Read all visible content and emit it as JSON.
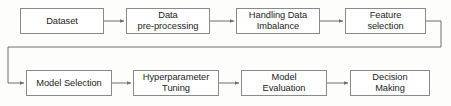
{
  "diagram": {
    "background_color": "#fdfdfc",
    "box_fill": "#ffffff",
    "box_border_color": "#8a8a8a",
    "connector_color": "#6f6f6f",
    "text_color": "#1d1d1d",
    "rows": [
      {
        "name": "top-row",
        "nodes": [
          {
            "id": "dataset",
            "label": "Dataset",
            "x": 20,
            "y": 8,
            "w": 84,
            "h": 26
          },
          {
            "id": "data-preprocessing",
            "label": "Data\npre-processing",
            "x": 126,
            "y": 8,
            "w": 84,
            "h": 26
          },
          {
            "id": "handling-data-imbalance",
            "label": "Handling Data\nImbalance",
            "x": 236,
            "y": 8,
            "w": 84,
            "h": 26
          },
          {
            "id": "feature-selection",
            "label": "Feature\nselection",
            "x": 345,
            "y": 8,
            "w": 81,
            "h": 26
          }
        ]
      },
      {
        "name": "bottom-row",
        "nodes": [
          {
            "id": "model-selection",
            "label": "Model Selection",
            "x": 26,
            "y": 70,
            "w": 86,
            "h": 26
          },
          {
            "id": "hyperparameter-tuning",
            "label": "Hyperparameter\nTuning",
            "x": 133,
            "y": 70,
            "w": 86,
            "h": 26
          },
          {
            "id": "model-evaluation",
            "label": "Model\nEvaluation",
            "x": 241,
            "y": 70,
            "w": 86,
            "h": 26
          },
          {
            "id": "decision-making",
            "label": "Decision\nMaking",
            "x": 350,
            "y": 70,
            "w": 80,
            "h": 26
          }
        ]
      }
    ],
    "connectors": [
      {
        "id": "dataset-to-preprocessing",
        "from": "dataset",
        "to": "data-preprocessing",
        "type": "straight-arrow"
      },
      {
        "id": "preprocessing-to-imbalance",
        "from": "data-preprocessing",
        "to": "handling-data-imbalance",
        "type": "straight-arrow"
      },
      {
        "id": "imbalance-to-feature-selection",
        "from": "handling-data-imbalance",
        "to": "feature-selection",
        "type": "straight-arrow"
      },
      {
        "id": "feature-selection-to-model-selection",
        "from": "feature-selection",
        "to": "model-selection",
        "type": "wrap-around-arrow"
      },
      {
        "id": "model-selection-to-tuning",
        "from": "model-selection",
        "to": "hyperparameter-tuning",
        "type": "straight-arrow"
      },
      {
        "id": "tuning-to-evaluation",
        "from": "hyperparameter-tuning",
        "to": "model-evaluation",
        "type": "straight-arrow"
      },
      {
        "id": "evaluation-to-decision",
        "from": "model-evaluation",
        "to": "decision-making",
        "type": "straight-arrow"
      }
    ]
  }
}
